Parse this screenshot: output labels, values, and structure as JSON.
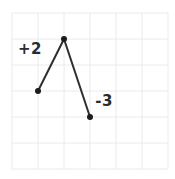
{
  "chart_data": {
    "type": "line",
    "title": "",
    "xlabel": "",
    "ylabel": "",
    "x": [
      1,
      2,
      3
    ],
    "y": [
      3,
      5,
      2
    ],
    "xlim": [
      0,
      6
    ],
    "ylim": [
      0,
      6
    ],
    "grid": "on",
    "axes_visible": false,
    "tick_labels_visible": false,
    "legend": "none",
    "annotations": [
      {
        "text": "+2",
        "x": 0.69,
        "y": 4.62
      },
      {
        "text": "-3",
        "x": 3.54,
        "y": 2.62
      }
    ],
    "segment_slopes": [
      "+2",
      "-3"
    ]
  },
  "style": {
    "background": "#ffffff",
    "grid_color": "#eaeaea",
    "line_color": "#2e2e2e",
    "point_color": "#1c1c1c",
    "label_color": "#2b2b2b"
  },
  "geometry": {
    "cell_px": 26,
    "origin_x_px": 12,
    "origin_y_px": 169,
    "point_radius_px": 3,
    "line_width_px": 2
  }
}
